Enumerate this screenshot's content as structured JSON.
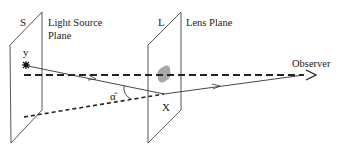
{
  "diagram": {
    "type": "gravitational-lensing-geometry",
    "source_plane": {
      "letter": "S",
      "label_line1": "Light Source",
      "label_line2": "Plane"
    },
    "lens_plane": {
      "letter": "L",
      "label": "Lens Plane"
    },
    "observer": {
      "label": "Observer"
    },
    "labels": {
      "source_position": "y",
      "deflection_angle": "α̂",
      "image_position": "X"
    },
    "colors": {
      "line": "#333333",
      "lens_mass": "#a8a8a8",
      "background": "#ffffff"
    }
  }
}
